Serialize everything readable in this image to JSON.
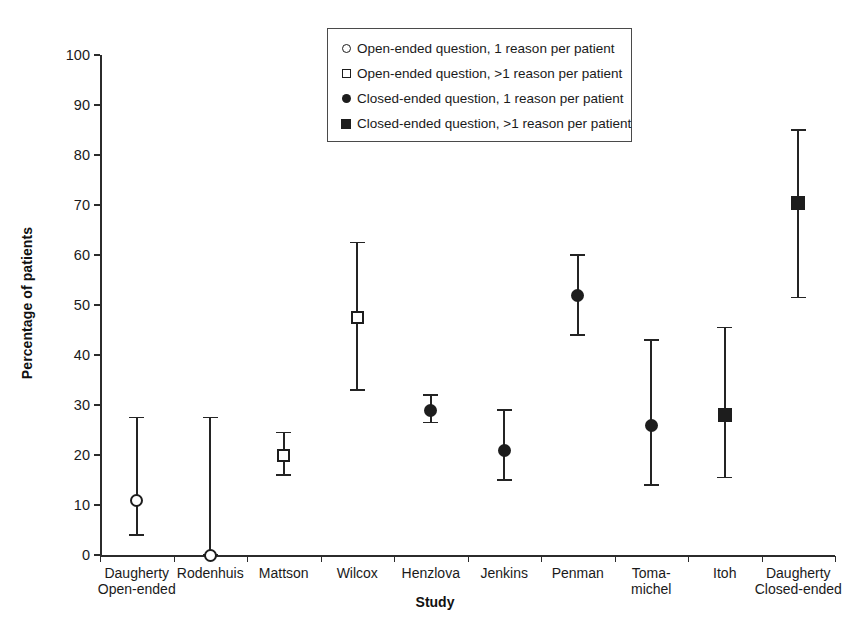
{
  "chart_data": {
    "type": "scatter",
    "title": "",
    "xlabel": "Study",
    "ylabel": "Percentage of patients",
    "ylim": [
      0,
      100
    ],
    "ytick_values": [
      0,
      10,
      20,
      30,
      40,
      50,
      60,
      70,
      80,
      90,
      100
    ],
    "ytick_labels": [
      "0",
      "10",
      "20",
      "30",
      "40",
      "50",
      "60",
      "70",
      "80",
      "90",
      "100"
    ],
    "grid": false,
    "legend_position": "top-center",
    "error_bars": "vertical, capped (95% confidence interval)",
    "categories": [
      "Daugherty Open-ended",
      "Rodenhuis",
      "Mattson",
      "Wilcox",
      "Henzlova",
      "Jenkins",
      "Penman",
      "Toma-michel",
      "Itoh",
      "Daugherty Closed-ended"
    ],
    "category_labels": [
      {
        "line1": "Daugherty",
        "line2": "Open-ended"
      },
      {
        "line1": "Rodenhuis",
        "line2": ""
      },
      {
        "line1": "Mattson",
        "line2": ""
      },
      {
        "line1": "Wilcox",
        "line2": ""
      },
      {
        "line1": "Henzlova",
        "line2": ""
      },
      {
        "line1": "Jenkins",
        "line2": ""
      },
      {
        "line1": "Penman",
        "line2": ""
      },
      {
        "line1": "Toma-",
        "line2": "michel"
      },
      {
        "line1": "Itoh",
        "line2": ""
      },
      {
        "line1": "Daugherty",
        "line2": "Closed-ended"
      }
    ],
    "points": [
      {
        "category": "Daugherty Open-ended",
        "value": 11.0,
        "low": 4.0,
        "high": 27.5,
        "marker": "circle-open",
        "series": "Open-ended question, 1 reason per patient"
      },
      {
        "category": "Rodenhuis",
        "value": 0.0,
        "low": 0.0,
        "high": 27.5,
        "marker": "circle-open",
        "series": "Open-ended question, 1 reason per patient"
      },
      {
        "category": "Mattson",
        "value": 20.0,
        "low": 16.0,
        "high": 24.5,
        "marker": "square-open",
        "series": "Open-ended question, >1 reason per patient"
      },
      {
        "category": "Wilcox",
        "value": 47.5,
        "low": 33.0,
        "high": 62.5,
        "marker": "square-open",
        "series": "Open-ended question, >1 reason per patient"
      },
      {
        "category": "Henzlova",
        "value": 29.0,
        "low": 26.5,
        "high": 32.0,
        "marker": "circle-filled",
        "series": "Closed-ended question, 1 reason per patient"
      },
      {
        "category": "Jenkins",
        "value": 21.0,
        "low": 15.0,
        "high": 29.0,
        "marker": "circle-filled",
        "series": "Closed-ended question, 1 reason per patient"
      },
      {
        "category": "Penman",
        "value": 52.0,
        "low": 44.0,
        "high": 60.0,
        "marker": "circle-filled",
        "series": "Closed-ended question, 1 reason per patient"
      },
      {
        "category": "Toma-michel",
        "value": 26.0,
        "low": 14.0,
        "high": 43.0,
        "marker": "circle-filled",
        "series": "Closed-ended question, 1 reason per patient"
      },
      {
        "category": "Itoh",
        "value": 28.0,
        "low": 15.5,
        "high": 45.5,
        "marker": "square-filled",
        "series": "Closed-ended question, >1 reason per patient"
      },
      {
        "category": "Daugherty Closed-ended",
        "value": 70.5,
        "low": 51.5,
        "high": 85.0,
        "marker": "square-filled",
        "series": "Closed-ended question, >1 reason per patient"
      }
    ],
    "legend": [
      {
        "marker": "circle-open",
        "label": "Open-ended question, 1 reason per patient"
      },
      {
        "marker": "square-open",
        "label": "Open-ended question, >1 reason per patient"
      },
      {
        "marker": "circle-filled",
        "label": "Closed-ended question, 1 reason per patient"
      },
      {
        "marker": "square-filled",
        "label": "Closed-ended question, >1 reason per patient"
      }
    ],
    "colors": {
      "marker": "#1d1d1d",
      "axis": "#2b2b2b",
      "background": "#ffffff",
      "legend_border": "#4a4a4a"
    }
  }
}
